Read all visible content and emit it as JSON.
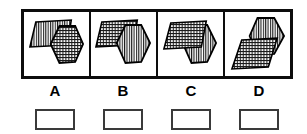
{
  "figure": {
    "kind": "multiple-choice-figure-question",
    "panel_count": 4,
    "frame_color": "#0d0d0d",
    "background_color": "#ffffff",
    "shape_outline_color": "#000000",
    "hatch_color": "#1a1a1a"
  },
  "panels": [
    {
      "id": "panel-a",
      "label": "A",
      "shapes": [
        {
          "name": "striped-parallelogram",
          "fill_pattern": "vertical-stripes",
          "position": "upper-left",
          "depth": "behind"
        },
        {
          "name": "crosshatched-hexagon",
          "fill_pattern": "cross-hatch",
          "position": "center-right",
          "depth": "front"
        }
      ]
    },
    {
      "id": "panel-b",
      "label": "B",
      "shapes": [
        {
          "name": "crosshatched-parallelogram",
          "fill_pattern": "cross-hatch",
          "position": "upper-left",
          "depth": "behind"
        },
        {
          "name": "striped-hexagon",
          "fill_pattern": "vertical-stripes",
          "position": "center-right",
          "depth": "front"
        }
      ]
    },
    {
      "id": "panel-c",
      "label": "C",
      "shapes": [
        {
          "name": "striped-hexagon",
          "fill_pattern": "vertical-stripes",
          "position": "center-right",
          "depth": "behind"
        },
        {
          "name": "crosshatched-parallelogram",
          "fill_pattern": "cross-hatch",
          "position": "upper-left",
          "depth": "front"
        }
      ]
    },
    {
      "id": "panel-d",
      "label": "D",
      "shapes": [
        {
          "name": "striped-hexagon",
          "fill_pattern": "vertical-stripes",
          "position": "upper-right",
          "depth": "behind"
        },
        {
          "name": "crosshatched-parallelogram",
          "fill_pattern": "cross-hatch",
          "position": "lower-left",
          "depth": "front"
        }
      ]
    }
  ],
  "answers": {
    "boxes": [
      {
        "id": "answer-box-a",
        "for_label": "A",
        "value": "",
        "checked": false
      },
      {
        "id": "answer-box-b",
        "for_label": "B",
        "value": "",
        "checked": false
      },
      {
        "id": "answer-box-c",
        "for_label": "C",
        "value": "",
        "checked": false
      },
      {
        "id": "answer-box-d",
        "for_label": "D",
        "value": "",
        "checked": false
      }
    ],
    "box_border_color": "#3a3a3a"
  }
}
